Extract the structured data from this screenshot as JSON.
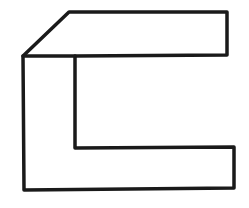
{
  "diagram": {
    "type": "line-drawing",
    "stroke_color": "#1a1a1a",
    "background_color": "#ffffff",
    "stroke_width": 3.5,
    "outline_points": "69,12 227,12 227,55 75,56 75,148 234,147 234,188 24,190 23,56",
    "top_face_bottom_edge": {
      "x1": 23,
      "y1": 56,
      "x2": 75,
      "y2": 56
    },
    "top_chamfer_edge": {
      "x1": 23,
      "y1": 56,
      "x2": 69,
      "y2": 12
    }
  }
}
